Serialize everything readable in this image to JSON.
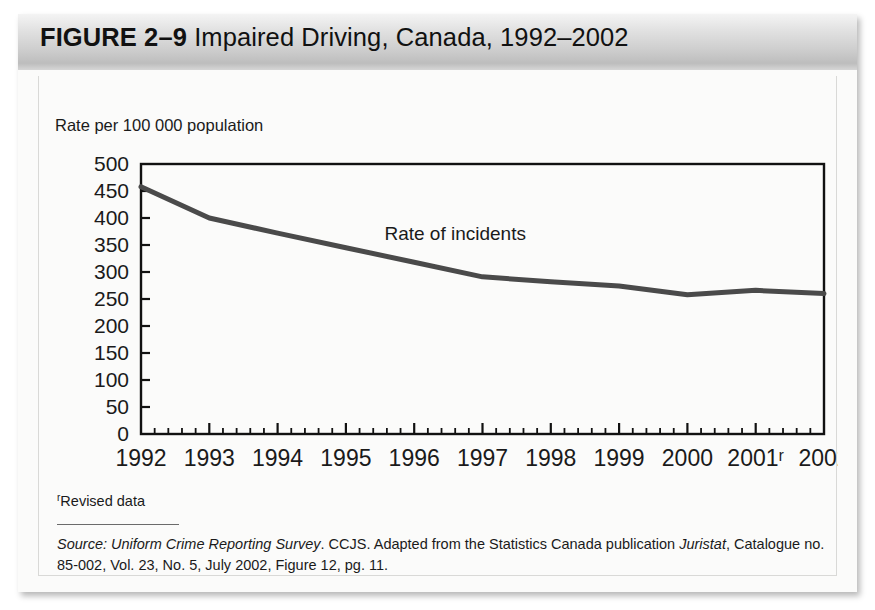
{
  "figure": {
    "label": "FIGURE 2–9",
    "title_rest": " Impaired Driving, Canada, 1992–2002",
    "full_title": "FIGURE 2–9 Impaired Driving, Canada, 1992–2002"
  },
  "axis_caption": "Rate per 100 000 population",
  "footnote": {
    "marker": "r",
    "text": "Revised data"
  },
  "source": {
    "prefix": "Source:",
    "publication": "Uniform Crime Reporting Survey",
    "middle": ". CCJS. Adapted from the Statistics Canada publication ",
    "journal": "Juristat",
    "line2": "Catalogue no. 85-002, Vol. 23, No. 5, July 2002, Figure 12, pg. 11."
  },
  "colors": {
    "line": "#4a4a4a",
    "axis": "#111111",
    "title_bar_dark": "#bdbdbd",
    "panel_bg": "#fbfbfa",
    "text": "#1a1a1a"
  },
  "chart_data": {
    "type": "line",
    "title": "Impaired Driving, Canada, 1992–2002",
    "xlabel": "",
    "ylabel": "Rate per 100 000 population",
    "ylim": [
      0,
      500
    ],
    "ytick_step": 50,
    "yticks": [
      0,
      50,
      100,
      150,
      200,
      250,
      300,
      350,
      400,
      450,
      500
    ],
    "ytick_labels": [
      "0",
      "50",
      "100",
      "150",
      "200",
      "250",
      "300",
      "350",
      "400",
      "450",
      "500"
    ],
    "categories": [
      1992,
      1993,
      1994,
      1995,
      1996,
      1997,
      1998,
      1999,
      2000,
      2001,
      2002
    ],
    "xtick_labels": [
      "1992",
      "1993",
      "1994",
      "1995",
      "1996",
      "1997",
      "1998",
      "1999",
      "2000",
      "2001ʳ",
      "2002"
    ],
    "x_minor_ticks_per_interval": 4,
    "grid": false,
    "legend": "none",
    "series": [
      {
        "name": "Rate of incidents",
        "values": [
          458,
          400,
          372,
          345,
          318,
          291,
          282,
          274,
          258,
          266,
          260
        ]
      }
    ],
    "annotations": [
      {
        "text": "Rate of incidents",
        "x": 1996.6,
        "y": 360
      }
    ]
  }
}
